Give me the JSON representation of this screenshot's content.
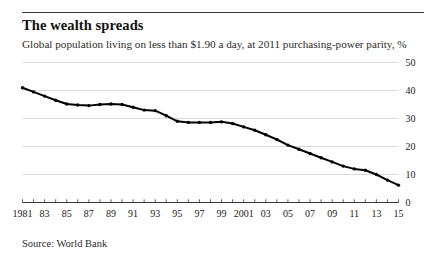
{
  "figure": {
    "title": "The wealth spreads",
    "subtitle": "Global population living on less than $1.90 a day, at 2011 purchasing-power parity, %",
    "source": "Source: World Bank"
  },
  "chart_data": {
    "type": "line",
    "title": "The wealth spreads",
    "subtitle": "Global population living on less than $1.90 a day, at 2011 purchasing-power parity, %",
    "xlabel": "",
    "ylabel": "%",
    "ylim": [
      0,
      50
    ],
    "xlim": [
      1981,
      2015
    ],
    "yticks": [
      0,
      10,
      20,
      30,
      40,
      50
    ],
    "ytick_labels": [
      "0",
      "10",
      "20",
      "30",
      "40",
      "50"
    ],
    "y_axis_position": "right",
    "grid": true,
    "grid_axis": "y",
    "legend": false,
    "markers": true,
    "line_color": "#000000",
    "xticks": [
      1981,
      1982,
      1983,
      1984,
      1985,
      1986,
      1987,
      1988,
      1989,
      1990,
      1991,
      1992,
      1993,
      1994,
      1995,
      1996,
      1997,
      1998,
      1999,
      2000,
      2001,
      2002,
      2003,
      2004,
      2005,
      2006,
      2007,
      2008,
      2009,
      2010,
      2011,
      2012,
      2013,
      2014,
      2015
    ],
    "xtick_labels": [
      "1981",
      "",
      "83",
      "",
      "85",
      "",
      "87",
      "",
      "89",
      "",
      "91",
      "",
      "93",
      "",
      "95",
      "",
      "97",
      "",
      "99",
      "",
      "2001",
      "",
      "03",
      "",
      "05",
      "",
      "07",
      "",
      "09",
      "",
      "11",
      "",
      "13",
      "",
      "15"
    ],
    "x": [
      1981,
      1982,
      1983,
      1984,
      1985,
      1986,
      1987,
      1988,
      1989,
      1990,
      1991,
      1992,
      1993,
      1994,
      1995,
      1996,
      1997,
      1998,
      1999,
      2000,
      2001,
      2002,
      2003,
      2004,
      2005,
      2006,
      2007,
      2008,
      2009,
      2010,
      2011,
      2012,
      2013,
      2014,
      2015
    ],
    "values": [
      41.0,
      39.5,
      38.0,
      36.5,
      35.2,
      34.8,
      34.6,
      35.0,
      35.2,
      35.0,
      34.0,
      33.0,
      32.8,
      31.0,
      29.0,
      28.6,
      28.6,
      28.6,
      28.8,
      28.2,
      27.0,
      25.8,
      24.2,
      22.5,
      20.5,
      19.0,
      17.5,
      16.0,
      14.5,
      13.0,
      12.0,
      11.5,
      10.0,
      8.0,
      6.2
    ],
    "series": [
      {
        "name": "Global population living on less than $1.90 a day",
        "values": [
          41.0,
          39.5,
          38.0,
          36.5,
          35.2,
          34.8,
          34.6,
          35.0,
          35.2,
          35.0,
          34.0,
          33.0,
          32.8,
          31.0,
          29.0,
          28.6,
          28.6,
          28.6,
          28.8,
          28.2,
          27.0,
          25.8,
          24.2,
          22.5,
          20.5,
          19.0,
          17.5,
          16.0,
          14.5,
          13.0,
          12.0,
          11.5,
          10.0,
          8.0,
          6.2
        ]
      }
    ]
  }
}
